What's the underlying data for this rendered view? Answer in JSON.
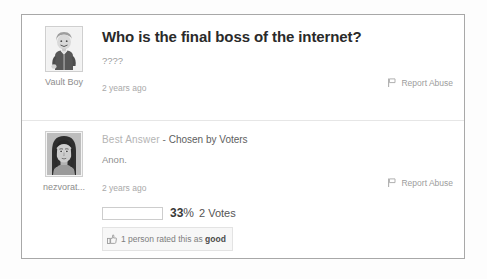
{
  "colors": {
    "card_border": "#a8a8a8",
    "divider": "#e6e6e6",
    "title_text": "#2a2a2a",
    "muted_text": "#9a9a9a",
    "best_answer_label": "#b4b4b4",
    "pill_background": "#f7f7f7"
  },
  "question": {
    "author": {
      "name": "Vault Boy",
      "avatar_icon": "vault-boy-avatar"
    },
    "title": "Who is the final boss of the internet?",
    "detail": "????",
    "timestamp": "2 years ago",
    "report_abuse_label": "Report Abuse",
    "report_abuse_icon": "flag-icon"
  },
  "answer": {
    "author": {
      "name": "nezvorat...",
      "avatar_icon": "female-portrait-avatar"
    },
    "best_answer_label": "Best Answer",
    "separator": " - ",
    "chosen_by": "Chosen by Voters",
    "body": "Anon.",
    "timestamp": "2 years ago",
    "report_abuse_label": "Report Abuse",
    "report_abuse_icon": "flag-icon",
    "votes": {
      "percent": "33",
      "percent_sign": "%",
      "count_label": "2 Votes",
      "bar_fill_percent": 0
    },
    "rating": {
      "icon": "thumbs-up-icon",
      "prefix": "1 person rated this as ",
      "verdict": "good"
    }
  }
}
